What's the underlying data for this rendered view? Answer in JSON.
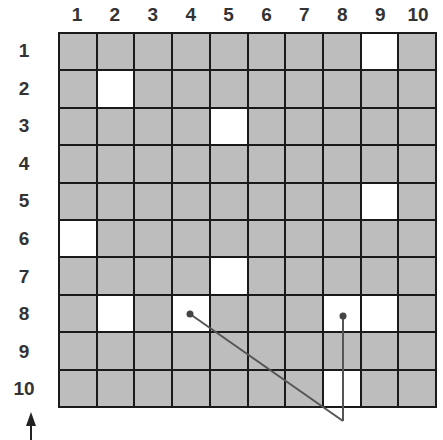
{
  "columns": [
    "1",
    "2",
    "3",
    "4",
    "5",
    "6",
    "7",
    "8",
    "9",
    "10"
  ],
  "rows": [
    "1",
    "2",
    "3",
    "4",
    "5",
    "6",
    "7",
    "8",
    "9",
    "10"
  ],
  "colors": {
    "filled": "#bdbdbd",
    "empty": "#ffffff",
    "grid_line": "#1a1a1a",
    "annotation": "#555555"
  },
  "white_cells": [
    {
      "row": 1,
      "col": 9
    },
    {
      "row": 2,
      "col": 2
    },
    {
      "row": 3,
      "col": 5
    },
    {
      "row": 5,
      "col": 9
    },
    {
      "row": 6,
      "col": 1
    },
    {
      "row": 7,
      "col": 5
    },
    {
      "row": 8,
      "col": 2
    },
    {
      "row": 8,
      "col": 4
    },
    {
      "row": 8,
      "col": 8
    },
    {
      "row": 8,
      "col": 9
    },
    {
      "row": 10,
      "col": 8
    }
  ],
  "pointers": [
    {
      "from": {
        "row": 8,
        "col": 4
      },
      "to": "below-grid"
    },
    {
      "from": {
        "row": 8,
        "col": 8
      },
      "to": "below-grid"
    }
  ],
  "arrow": {
    "direction": "up"
  }
}
